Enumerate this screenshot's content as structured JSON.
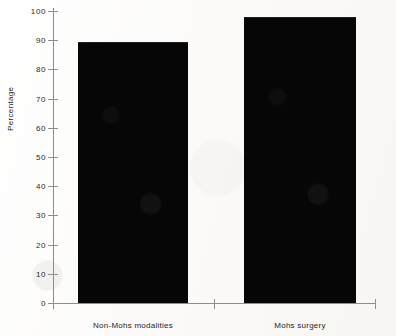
{
  "chart_data": {
    "type": "bar",
    "title": "",
    "xlabel": "",
    "ylabel": "Percentage",
    "categories": [
      "Non-Mohs modalities",
      "Mohs surgery"
    ],
    "values": [
      89.5,
      98
    ],
    "ylim": [
      0,
      100
    ],
    "ytick_labels": [
      "0",
      "10",
      "20",
      "30",
      "40",
      "50",
      "60",
      "70",
      "80",
      "90",
      "100"
    ],
    "ytick_values": [
      0,
      10,
      20,
      30,
      40,
      50,
      60,
      70,
      80,
      90,
      100
    ],
    "grid": false,
    "legend": false,
    "bar_color": "#060606",
    "axis_color": "#8d8d8d",
    "background_color": "#fdfdfc"
  }
}
